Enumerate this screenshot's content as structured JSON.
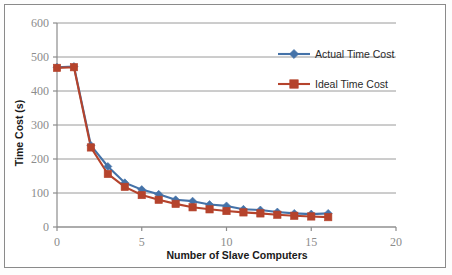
{
  "chart_data": {
    "type": "line",
    "title": "",
    "subtitle": "",
    "xlabel": "Number of Slave Computers",
    "ylabel": "Time Cost (s)",
    "xlim": [
      0,
      20
    ],
    "ylim": [
      0,
      600
    ],
    "xticks": [
      0,
      5,
      10,
      15,
      20
    ],
    "yticks": [
      0,
      100,
      200,
      300,
      400,
      500,
      600
    ],
    "xtick_labels": [
      "0",
      "5",
      "10",
      "15",
      "20"
    ],
    "ytick_labels": [
      "0",
      "100",
      "200",
      "300",
      "400",
      "500",
      "600"
    ],
    "grid": "horizontal",
    "legend_position": "top-right",
    "x": [
      0,
      1,
      2,
      3,
      4,
      5,
      6,
      7,
      8,
      9,
      10,
      11,
      12,
      13,
      14,
      15,
      16
    ],
    "series": [
      {
        "name": "Actual Time Cost",
        "color": "#4472a8",
        "marker": "diamond",
        "values": [
          470,
          472,
          240,
          178,
          130,
          110,
          96,
          80,
          76,
          66,
          62,
          52,
          50,
          44,
          40,
          38,
          40
        ]
      },
      {
        "name": "Ideal Time Cost",
        "color": "#b5432c",
        "marker": "square",
        "values": [
          468,
          470,
          234,
          156,
          118,
          94,
          80,
          68,
          58,
          52,
          47,
          43,
          40,
          36,
          33,
          31,
          29
        ]
      }
    ]
  },
  "legend": {
    "entries": [
      {
        "label": "Actual Time Cost",
        "color": "#4472a8",
        "marker": "diamond-marker-icon"
      },
      {
        "label": "Ideal Time Cost",
        "color": "#b5432c",
        "marker": "square-marker-icon"
      }
    ]
  },
  "colors": {
    "actual": "#4472a8",
    "ideal": "#b5432c",
    "gridline": "#9a9a9a",
    "axis": "#8c8c8c",
    "tick_text": "#8c8c8c",
    "title_text": "#1a1a1a",
    "frame_border": "#8a8a8a",
    "page_background": "#fdfdfd",
    "plot_background": "#ffffff"
  }
}
